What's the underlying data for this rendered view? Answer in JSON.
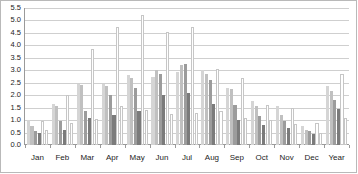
{
  "chart": {
    "title": "",
    "xlabel": "",
    "ylabel": ""
  },
  "chart_data": {
    "type": "bar",
    "title": "",
    "xlabel": "",
    "ylabel": "",
    "ylim": [
      0.0,
      5.5
    ],
    "ytick_step": 0.5,
    "grid": true,
    "legend": "none",
    "categories": [
      "Jan",
      "Feb",
      "Mar",
      "Apr",
      "May",
      "Jun",
      "Jul",
      "Aug",
      "Sep",
      "Oct",
      "Nov",
      "Dec",
      "Year"
    ],
    "ytick_labels": [
      "5.5",
      "5.0",
      "4.5",
      "4.0",
      "3.5",
      "3.0",
      "2.5",
      "2.0",
      "1.5",
      "1.0",
      "0.5",
      "0.0"
    ],
    "colors": {
      "series1": "#d5d5d5",
      "series2": "#c0c0c0",
      "series3": "#9c9c9c",
      "series4": "#7b7b7b",
      "series5": "#5f5f5f",
      "outline": "#ffffff",
      "outline_border": "#c6c6c6",
      "gridline": "#cfcfcf",
      "axis": "#9a9a9a",
      "frame": "#b9b9b9",
      "text": "#1d1d1d"
    },
    "series": [
      {
        "name": "Series 1",
        "style": "fill-light",
        "values": [
          1.0,
          1.65,
          2.45,
          2.45,
          2.8,
          2.75,
          2.95,
          3.0,
          2.3,
          1.75,
          1.55,
          0.75,
          2.35
        ]
      },
      {
        "name": "Series 2",
        "style": "fill-medium",
        "values": [
          0.75,
          1.55,
          2.4,
          2.35,
          2.7,
          3.0,
          3.2,
          2.85,
          2.25,
          1.55,
          1.2,
          0.6,
          2.15
        ]
      },
      {
        "name": "Series 3",
        "style": "fill-dark",
        "values": [
          0.55,
          0.95,
          1.35,
          2.0,
          2.3,
          2.85,
          3.25,
          2.6,
          1.6,
          1.15,
          0.95,
          0.55,
          1.8
        ]
      },
      {
        "name": "Series 4",
        "style": "fill-darkest",
        "values": [
          0.5,
          0.6,
          1.1,
          1.2,
          1.35,
          2.0,
          2.1,
          1.65,
          1.0,
          0.8,
          0.7,
          0.45,
          1.45
        ]
      },
      {
        "name": "Series 5",
        "style": "outline",
        "values": [
          0.95,
          2.0,
          3.85,
          4.75,
          5.2,
          4.55,
          4.75,
          3.05,
          2.7,
          1.6,
          1.5,
          0.9,
          2.85
        ]
      },
      {
        "name": "Series 6",
        "style": "outline",
        "values": [
          0.6,
          0.9,
          1.05,
          1.55,
          1.4,
          1.25,
          1.3,
          1.35,
          1.1,
          1.0,
          0.85,
          0.5,
          1.1
        ]
      }
    ]
  }
}
